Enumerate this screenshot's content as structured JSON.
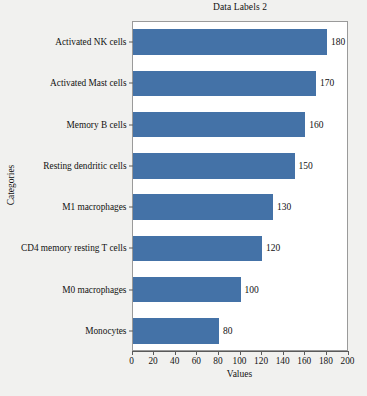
{
  "chart_data": {
    "type": "bar",
    "orientation": "horizontal",
    "title": "Data Labels 2",
    "xlabel": "Values",
    "ylabel": "Categories",
    "categories": [
      "Activated NK cells",
      "Activated Mast cells",
      "Memory B cells",
      "Resting dendritic cells",
      "M1 macrophages",
      "CD4 memory resting T cells",
      "M0 macrophages",
      "Monocytes"
    ],
    "values": [
      180,
      170,
      160,
      150,
      130,
      120,
      100,
      80
    ],
    "data_labels": [
      "180",
      "170",
      "160",
      "150",
      "130",
      "120",
      "100",
      "80"
    ],
    "xlim": [
      0,
      200
    ],
    "xticks": [
      0,
      20,
      40,
      60,
      80,
      100,
      120,
      140,
      160,
      180,
      200
    ],
    "xtick_labels": [
      "0",
      "20",
      "40",
      "60",
      "80",
      "100",
      "120",
      "140",
      "160",
      "180",
      "200"
    ],
    "grid": false,
    "legend": null,
    "bar_color": "#4472a7",
    "plot_background": "#ffffff",
    "figure_background": "#f1f1ef",
    "axis_color": "#5a5a5a"
  }
}
